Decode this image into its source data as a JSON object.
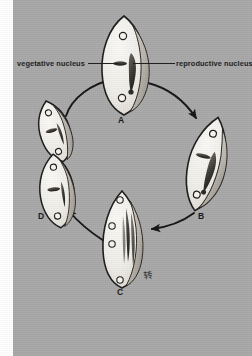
{
  "figure": {
    "background_color": "#a8a8a8",
    "ink_color": "#161616",
    "cell_fill": "#f2f0ec",
    "callouts": [
      {
        "id": "vegetative",
        "text": "vegetative nucleus",
        "side": "left"
      },
      {
        "id": "reproductive",
        "text": "reproductive nucleus",
        "side": "right"
      }
    ],
    "stages": [
      {
        "id": "a",
        "label": "A",
        "position": "top",
        "description": "pollen grain with vegetative and reproductive nucleus"
      },
      {
        "id": "b",
        "label": "B",
        "position": "right",
        "description": "elongating pollen grain, nuclei shifting"
      },
      {
        "id": "c",
        "label": "C",
        "position": "bottom",
        "description": "elongated grain with multiple pores and strands"
      },
      {
        "id": "d",
        "label": "D",
        "position": "left",
        "description": "paired dividing grains"
      }
    ],
    "arrows": [
      {
        "from": "d",
        "to": "a"
      },
      {
        "from": "a",
        "to": "b"
      },
      {
        "from": "b",
        "to": "c"
      },
      {
        "from": "c",
        "to": "d"
      }
    ],
    "annotation_mark": "转"
  }
}
